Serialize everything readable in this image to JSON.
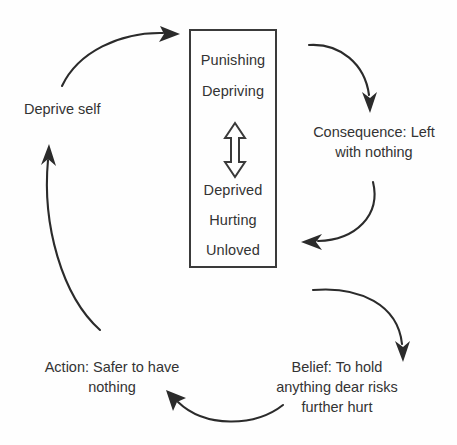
{
  "diagram": {
    "type": "vicious-cycle-flow",
    "title_visible": false,
    "colors": {
      "background": "#fefefe",
      "text": "#333333",
      "stroke": "#2b2b2b",
      "box_border": "#3a3a3a"
    },
    "core_box": {
      "name": "core-beliefs-box",
      "upper_lines": [
        "Punishing",
        "Depriving"
      ],
      "lower_lines": [
        "Deprived",
        "Hurting",
        "Unloved"
      ],
      "connector": "vertical-double-headed-arrow"
    },
    "nodes": [
      {
        "id": "consequence",
        "label": "Consequence: Left\nwith nothing",
        "align": "center"
      },
      {
        "id": "belief",
        "label": "Belief: To hold\nanything dear risks\nfurther hurt",
        "align": "center"
      },
      {
        "id": "action",
        "label": "Action: Safer to have\nnothing",
        "align": "center"
      },
      {
        "id": "deprive-self",
        "label": "Deprive self",
        "align": "left"
      }
    ],
    "arrows": [
      {
        "id": "action-to-core",
        "from": "deprive-self",
        "to": "core-beliefs-box",
        "direction": "right"
      },
      {
        "id": "core-to-consequence",
        "from": "core-beliefs-box",
        "to": "consequence",
        "direction": "down"
      },
      {
        "id": "consequence-to-core",
        "from": "consequence",
        "to": "core-beliefs-box",
        "direction": "left"
      },
      {
        "id": "consequence-to-belief",
        "from": "consequence",
        "to": "belief",
        "direction": "down"
      },
      {
        "id": "belief-to-action",
        "from": "belief",
        "to": "action",
        "direction": "up-left"
      },
      {
        "id": "action-to-deprive",
        "from": "action",
        "to": "deprive-self",
        "direction": "up"
      }
    ]
  }
}
